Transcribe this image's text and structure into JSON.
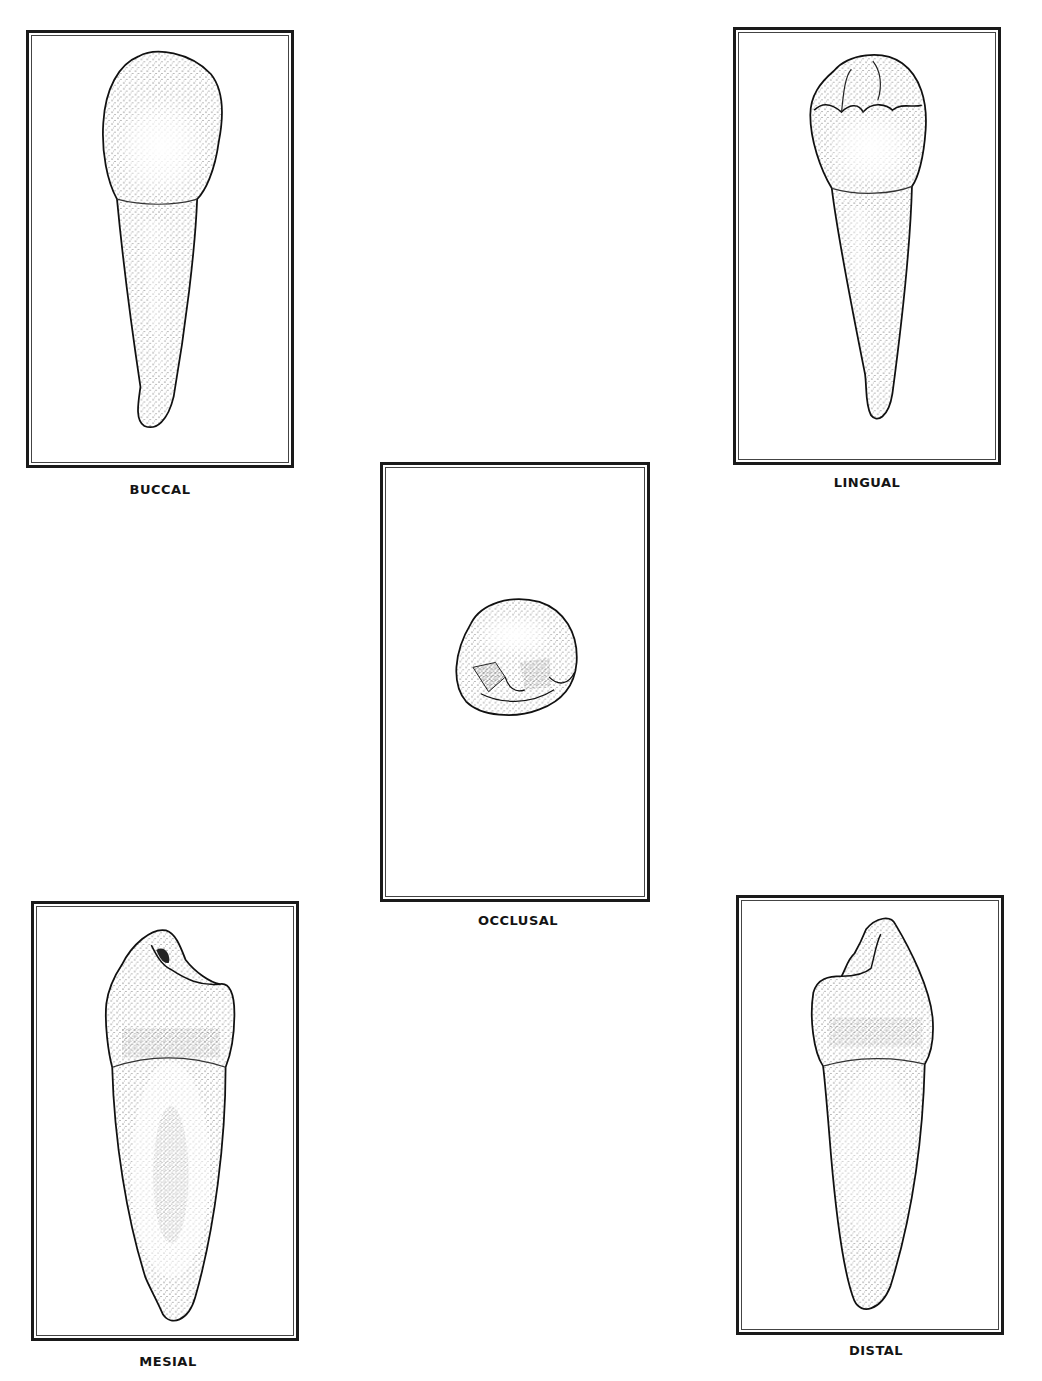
{
  "figure": {
    "views": [
      {
        "id": "buccal",
        "label": "BUCCAL"
      },
      {
        "id": "lingual",
        "label": "LINGUAL"
      },
      {
        "id": "occlusal",
        "label": "OCCLUSAL"
      },
      {
        "id": "mesial",
        "label": "MESIAL"
      },
      {
        "id": "distal",
        "label": "DISTAL"
      }
    ]
  },
  "colors": {
    "frame": "#1a1a1a",
    "ink": "#141414",
    "background": "#ffffff"
  }
}
